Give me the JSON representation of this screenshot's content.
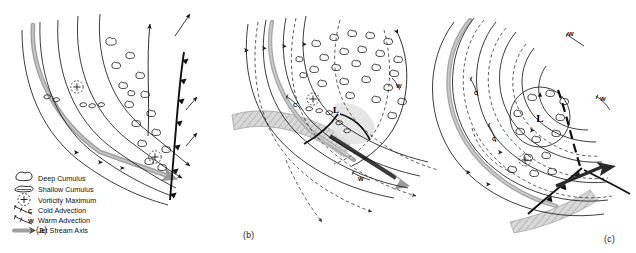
{
  "figure": {
    "kind": "three-panel synoptic cyclogenesis schematic",
    "background_color": "#ffffff",
    "ink_color": "#1a1a1a",
    "jet_color": "#9a9a9a",
    "front_color": "#111111",
    "panels": [
      {
        "id": "a",
        "label": "(a)",
        "stage": "incipient trough"
      },
      {
        "id": "b",
        "label": "(b)",
        "stage": "developing wave low"
      },
      {
        "id": "c",
        "label": "(c)",
        "stage": "mature occluded low"
      }
    ]
  },
  "legend": {
    "items": [
      {
        "symbol": "deep-cumulus-icon",
        "label": "Deep Cumulus"
      },
      {
        "symbol": "shallow-cumulus-icon",
        "label": "Shallow Cumulus"
      },
      {
        "symbol": "vorticity-maximum-icon",
        "label": "Vorticity Maximum"
      },
      {
        "symbol": "cold-advection-icon",
        "label": "Cold Advection"
      },
      {
        "symbol": "warm-advection-icon",
        "label": "Warm Advection"
      },
      {
        "symbol": "jet-stream-axis-icon",
        "label": "Jet Stream Axis"
      }
    ]
  },
  "annotations": {
    "low_center": "L",
    "cold_advection": "C",
    "warm_advection": "W",
    "vorticity_plus": "+"
  },
  "panel_a": {
    "label": "(a)",
    "vorticity_maxima": 2,
    "cold_front": true,
    "jet_stream_axis": true,
    "low_center": false
  },
  "panel_b": {
    "label": "(b)",
    "low_center": "L",
    "vorticity_maxima": 1,
    "cold_advection_labels": [
      "C"
    ],
    "warm_advection_labels": [
      "W",
      "W"
    ],
    "jet_stream_axis": true
  },
  "panel_c": {
    "label": "(c)",
    "low_center": "L",
    "vorticity_maxima": 1,
    "cold_advection_labels": [
      "C",
      "C"
    ],
    "warm_advection_labels": [
      "W",
      "W"
    ],
    "jet_stream_axis": true,
    "occluded": true
  }
}
